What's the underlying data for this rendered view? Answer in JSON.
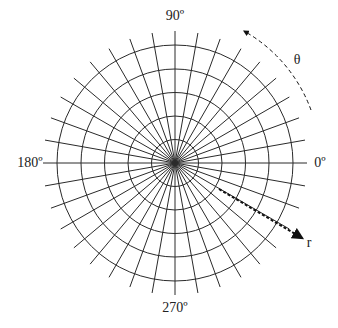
{
  "diagram": {
    "type": "polar-grid",
    "center": {
      "x": 175,
      "y": 163
    },
    "ring_radii": [
      23.5,
      47,
      70.5,
      94,
      118
    ],
    "ray_step_degrees": 10,
    "ray_length": 132,
    "stroke_color": "#2a2a2a",
    "angle_labels": [
      {
        "text": "90º",
        "x": 175,
        "y": 20,
        "anchor": "middle"
      },
      {
        "text": "0º",
        "x": 320,
        "y": 167,
        "anchor": "middle"
      },
      {
        "text": "180º",
        "x": 30,
        "y": 167,
        "anchor": "middle"
      },
      {
        "text": "270º",
        "x": 175,
        "y": 312,
        "anchor": "middle"
      }
    ],
    "theta_arrow": {
      "label": "θ",
      "label_x": 297,
      "label_y": 64,
      "arc_start": {
        "x": 311,
        "y": 110
      },
      "arc_end": {
        "x": 244,
        "y": 31
      }
    },
    "r_arrow": {
      "label": "r",
      "label_x": 309,
      "label_y": 247,
      "start": {
        "x": 219,
        "y": 189
      },
      "end": {
        "x": 302,
        "y": 238
      }
    }
  }
}
